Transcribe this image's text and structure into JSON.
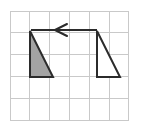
{
  "figure": {
    "type": "geometry-translation-diagram",
    "canvas": {
      "width": 145,
      "height": 126,
      "background": "#ffffff"
    },
    "grid": {
      "name": "square-grid",
      "columns": 6,
      "rows": 5,
      "x_left": 10,
      "y_top": 11,
      "cell_width": 19.8,
      "cell_height": 21.8,
      "line_color": "#c9c9c9",
      "border_color": "#c9c9c9",
      "line_width": 1,
      "x_lines": [
        10,
        29.8,
        49.6,
        69.4,
        89.2,
        109,
        128.8
      ],
      "y_lines": [
        11,
        32.8,
        54.6,
        76.4,
        98.2,
        120
      ]
    },
    "shapes": [
      {
        "name": "shaded-triangle",
        "label": "preimage",
        "points": "30,31 30,77 53,77",
        "fill": "#a3a3a3",
        "stroke": "#2b2b2b",
        "stroke_width": 2,
        "grid_vertices": "(1,1) (1,3) (2,3)"
      },
      {
        "name": "unshaded-triangle",
        "label": "image",
        "points": "97,31 97,77 120,77",
        "fill": "#ffffff",
        "stroke": "#2b2b2b",
        "stroke_width": 2,
        "grid_vertices": "(4.4,1) (4.4,3) (5.6,3)"
      }
    ],
    "arrow": {
      "name": "translation-arrow",
      "direction": "left",
      "tail_x": 97,
      "tip_x": 31,
      "y": 30,
      "head_wing_x": 67,
      "head_wing_offset": 6,
      "color": "#2b2b2b",
      "stroke_width": 2
    }
  }
}
